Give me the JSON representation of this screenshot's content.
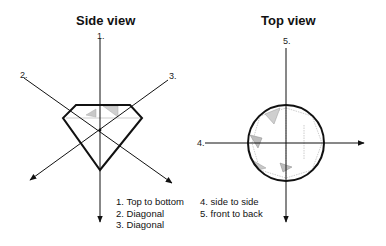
{
  "side_view": {
    "title": "Side view",
    "axis_labels": [
      "1.",
      "2.",
      "3."
    ],
    "legend": [
      "1.  Top to bottom",
      "2.  Diagonal",
      "3.  Diagonal"
    ]
  },
  "top_view": {
    "title": "Top view",
    "axis_labels": [
      "4.",
      "5."
    ],
    "legend": [
      "4.  side to side",
      "5.  front to back"
    ]
  },
  "colors": {
    "line": "#111111",
    "facet": "#9a9a9a",
    "background": "#ffffff"
  }
}
